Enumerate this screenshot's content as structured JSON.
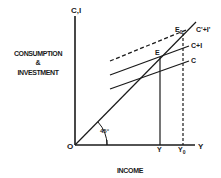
{
  "diagram": {
    "y_axis_label_top": "C,I",
    "y_axis_title_line1": "CONSUMPTION",
    "y_axis_title_line2": "&",
    "y_axis_title_line3": "INVESTMENT",
    "x_axis_title": "INCOME",
    "x_axis_end_label": "Y",
    "origin_label": "O",
    "angle_label": "45°",
    "lines": {
      "c_prime_i_prime": "C'+I'",
      "c_plus_i": "C+I",
      "c": "C"
    },
    "points": {
      "e": "E",
      "e0": "E",
      "e0_sub": "0"
    },
    "x_ticks": {
      "y": "Y",
      "y0": "Y",
      "y0_sub": "0"
    },
    "line_color": "#1a1a1a"
  }
}
